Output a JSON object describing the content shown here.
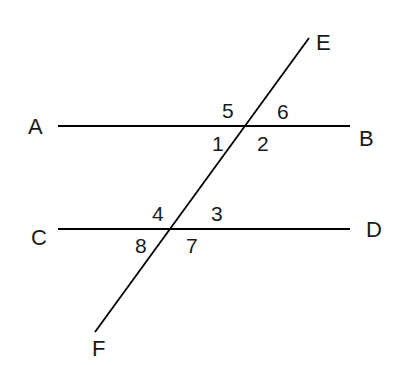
{
  "diagram": {
    "type": "geometry-parallel-lines-transversal",
    "colors": {
      "line": "#000000",
      "text": "#1a1a1a",
      "background": "#ffffff"
    },
    "lines": [
      {
        "id": "AB",
        "x1": 58,
        "y1": 126,
        "x2": 350,
        "y2": 126
      },
      {
        "id": "CD",
        "x1": 58,
        "y1": 229,
        "x2": 350,
        "y2": 229
      },
      {
        "id": "EF",
        "x1": 309,
        "y1": 38,
        "x2": 95,
        "y2": 332
      }
    ],
    "points": {
      "A": {
        "label": "A",
        "x": 28,
        "y": 134
      },
      "B": {
        "label": "B",
        "x": 359,
        "y": 146
      },
      "C": {
        "label": "C",
        "x": 31,
        "y": 245
      },
      "D": {
        "label": "D",
        "x": 366,
        "y": 237
      },
      "E": {
        "label": "E",
        "x": 316,
        "y": 50
      },
      "F": {
        "label": "F",
        "x": 92,
        "y": 356
      }
    },
    "angles": {
      "a1": {
        "label": "1",
        "x": 212,
        "y": 151
      },
      "a2": {
        "label": "2",
        "x": 257,
        "y": 151
      },
      "a3": {
        "label": "3",
        "x": 211,
        "y": 221
      },
      "a4": {
        "label": "4",
        "x": 152,
        "y": 221
      },
      "a5": {
        "label": "5",
        "x": 222,
        "y": 118
      },
      "a6": {
        "label": "6",
        "x": 277,
        "y": 119
      },
      "a7": {
        "label": "7",
        "x": 186,
        "y": 253
      },
      "a8": {
        "label": "8",
        "x": 135,
        "y": 253
      }
    }
  }
}
